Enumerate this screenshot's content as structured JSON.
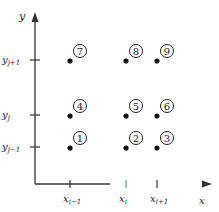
{
  "diagram": {
    "axes": {
      "x_label": "x",
      "y_label": "y"
    },
    "x_ticks": [
      {
        "main": "x",
        "sub": "i−1"
      },
      {
        "main": "x",
        "sub": "i"
      },
      {
        "main": "x",
        "sub": "i+1"
      }
    ],
    "y_ticks": [
      {
        "main": "y",
        "sub": "j+1"
      },
      {
        "main": "y",
        "sub": "j"
      },
      {
        "main": "y",
        "sub": "j−1"
      }
    ],
    "nodes": [
      {
        "label": "1",
        "col": 0,
        "row": 2
      },
      {
        "label": "2",
        "col": 1,
        "row": 2
      },
      {
        "label": "3",
        "col": 2,
        "row": 2
      },
      {
        "label": "4",
        "col": 0,
        "row": 1
      },
      {
        "label": "5",
        "col": 1,
        "row": 1
      },
      {
        "label": "6",
        "col": 2,
        "row": 1
      },
      {
        "label": "7",
        "col": 0,
        "row": 0
      },
      {
        "label": "8",
        "col": 1,
        "row": 0
      },
      {
        "label": "9",
        "col": 2,
        "row": 0
      }
    ],
    "colors": {
      "axis": "#333333",
      "axis_highlight_start": "#3aa04a",
      "axis_highlight_end": "#d04040"
    }
  }
}
